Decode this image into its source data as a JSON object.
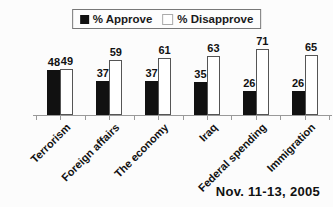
{
  "chart_data": {
    "type": "bar",
    "categories": [
      "Terrorism",
      "Foreign affairs",
      "The economy",
      "Iraq",
      "Federal spending",
      "Immigration"
    ],
    "series": [
      {
        "name": "% Approve",
        "color": "#111111",
        "values": [
          48,
          37,
          37,
          35,
          26,
          26
        ]
      },
      {
        "name": "% Disapprove",
        "color": "#ffffff",
        "values": [
          49,
          59,
          61,
          63,
          71,
          65
        ]
      }
    ],
    "title": "",
    "xlabel": "",
    "ylabel": "",
    "ylim": [
      0,
      80
    ],
    "grid": false,
    "legend_position": "top",
    "annotation": "Nov. 11-13, 2005"
  },
  "legend": {
    "approve_label": "% Approve",
    "disapprove_label": "% Disapprove"
  },
  "footer": {
    "date_label": "Nov. 11-13, 2005"
  }
}
